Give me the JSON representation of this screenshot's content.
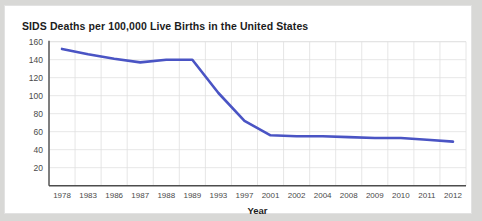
{
  "card": {
    "background": "#ffffff",
    "page_background": "#d8d8d6"
  },
  "chart_data": {
    "type": "line",
    "title": "SIDS Deaths per 100,000 Live Births in the United States",
    "xlabel": "Year",
    "ylabel": "",
    "categories": [
      "1978",
      "1983",
      "1986",
      "1987",
      "1988",
      "1989",
      "1993",
      "1997",
      "2001",
      "2002",
      "2004",
      "2008",
      "2009",
      "2010",
      "2011",
      "2012"
    ],
    "values": [
      152,
      146,
      141,
      137,
      140,
      140,
      103,
      72,
      56,
      55,
      55,
      54,
      53,
      53,
      51,
      49
    ],
    "series": [
      {
        "name": "SIDS deaths per 100,000 live births",
        "color": "#4a54c4",
        "values": [
          152,
          146,
          141,
          137,
          140,
          140,
          103,
          72,
          56,
          55,
          55,
          54,
          53,
          53,
          51,
          49
        ]
      }
    ],
    "ylim": [
      0,
      160
    ],
    "yticks": [
      20,
      40,
      60,
      80,
      100,
      120,
      140,
      160
    ],
    "ytick_labels": [
      "20",
      "40",
      "60",
      "80",
      "100",
      "120",
      "140",
      "160"
    ],
    "grid": true,
    "grid_color": "#e0e0e0",
    "legend": false,
    "legend_position": "none",
    "line_color": "#4a54c4",
    "axis_color": "#4d4d4d"
  }
}
